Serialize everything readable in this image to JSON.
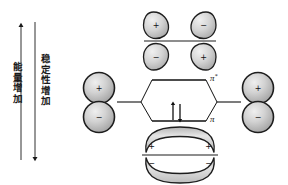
{
  "figure": {
    "title": "",
    "type": "molecular-orbital-energy-diagram",
    "background_color": "#ffffff"
  },
  "axes": {
    "energy": {
      "label": "能\n量\n增\n加",
      "label_plain": "能量增加",
      "arrow_direction": "up",
      "arrow_top_y": 24,
      "arrow_bottom_y": 160
    },
    "stability": {
      "label": "稳\n定\n性\n增\n加",
      "label_plain": "稳定性增加",
      "arrow_direction": "down",
      "arrow_top_y": 22,
      "arrow_bottom_y": 160
    }
  },
  "orbitals": {
    "left_atomic": {
      "name": "p-orbital-left",
      "top_sign": "+",
      "bottom_sign": "−"
    },
    "right_atomic": {
      "name": "p-orbital-right",
      "top_sign": "+",
      "bottom_sign": "−"
    },
    "antibonding_pi_star": {
      "name": "pi-star-antibonding-orbital",
      "top_left_sign": "+",
      "top_right_sign": "−",
      "bottom_left_sign": "−",
      "bottom_right_sign": "+",
      "nodal_plane": true
    },
    "bonding_pi": {
      "name": "pi-bonding-orbital",
      "upper_lobe_left_sign": "+",
      "upper_lobe_right_sign": "+",
      "lower_lobe_left_sign": "−",
      "lower_lobe_right_sign": "−",
      "nodal_plane": true
    }
  },
  "energy_levels": {
    "antibonding": {
      "label_symbol": "π",
      "label_superscript": "*",
      "electrons": 0,
      "occupancy": ""
    },
    "bonding": {
      "label_symbol": "π",
      "label_superscript": "",
      "electrons": 2,
      "occupancy": "↑↓"
    }
  },
  "colors": {
    "stroke": "#1a1a1a",
    "orbital_fill_light": "#e8e8e8",
    "orbital_fill_mid": "#c9c9c9",
    "orbital_fill_dark": "#a8a8a8",
    "level_line": "#111111",
    "background": "#ffffff"
  }
}
